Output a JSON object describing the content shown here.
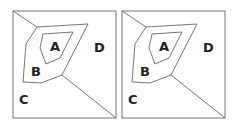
{
  "panels": [
    {
      "id": "left",
      "offset_x": 0,
      "labels": {
        "A": "A",
        "B": "B",
        "C": "C",
        "D": "D"
      }
    },
    {
      "id": "right",
      "offset_x": 109,
      "labels": {
        "A": "A",
        "B": "B",
        "C": "C",
        "D": "D"
      }
    }
  ],
  "colors": {
    "stroke": "#666666",
    "text": "#222222",
    "background": "#ffffff"
  }
}
